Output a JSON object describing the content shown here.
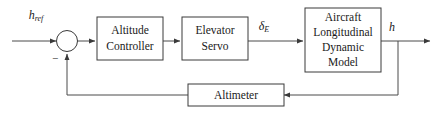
{
  "diagram": {
    "blocks": [
      {
        "id": "altitude_controller",
        "lines": [
          "Altitude",
          "Controller"
        ]
      },
      {
        "id": "elevator_servo",
        "lines": [
          "Elevator",
          "Servo"
        ]
      },
      {
        "id": "aircraft_model",
        "lines": [
          "Aircraft",
          "Longitudinal",
          "Dynamic",
          "Model"
        ]
      },
      {
        "id": "altimeter",
        "lines": [
          "Altimeter"
        ]
      }
    ],
    "signals": {
      "reference": {
        "symbol": "h",
        "subscript": "ref"
      },
      "elevator_deflection": {
        "symbol": "δ",
        "subscript": "E"
      },
      "output_altitude": {
        "symbol": "h",
        "subscript": ""
      }
    },
    "summing_junction": {
      "name": "summing-junction",
      "negative_sign": "−"
    },
    "colors": {
      "line": "#4a4a4a",
      "box_stroke": "#3a3a3a",
      "text": "#1a1a1a",
      "background": "#ffffff"
    }
  }
}
